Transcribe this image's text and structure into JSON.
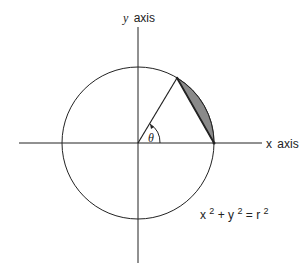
{
  "diagram": {
    "y_axis_label_var": "y",
    "y_axis_label_word": "axis",
    "x_axis_label_var": "x",
    "x_axis_label_word": "axis",
    "angle_label": "θ",
    "equation": {
      "x": "x",
      "x_exp": "2",
      "plus": "+",
      "y": "y",
      "y_exp": "2",
      "equals": "=",
      "r": "r",
      "r_exp": "2"
    },
    "colors": {
      "line": "#222222",
      "shaded_segment": "#8a8a8a",
      "background": "#ffffff"
    }
  }
}
